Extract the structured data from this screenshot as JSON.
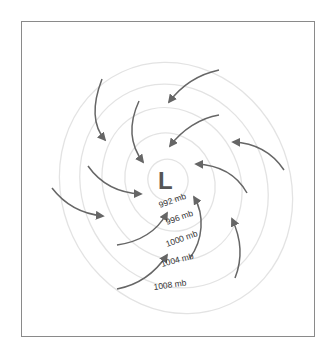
{
  "diagram": {
    "center": {
      "symbol": "L",
      "label": "Low pressure center"
    },
    "isobars": [
      {
        "label": "992 mb"
      },
      {
        "label": "996 mb"
      },
      {
        "label": "1000 mb"
      },
      {
        "label": "1004 mb"
      },
      {
        "label": "1008 mb"
      }
    ],
    "colors": {
      "frame": "#8a8a8a",
      "isobar": "#e3e3e3",
      "arrow": "#666666",
      "center_label": "#555555",
      "text": "#333333"
    },
    "arrows_count": 11,
    "arrow_direction": "inward, counterclockwise"
  }
}
